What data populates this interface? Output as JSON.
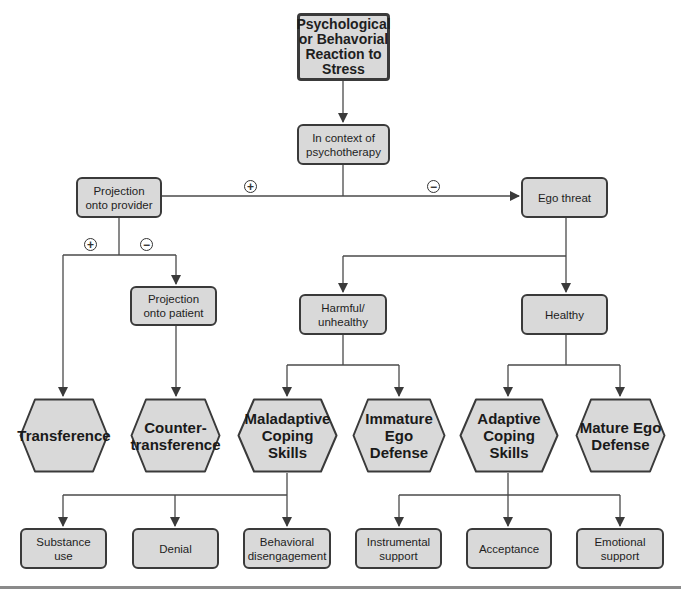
{
  "diagram": {
    "root": {
      "label": "Psychological or Behavorial Reaction to Stress"
    },
    "context": {
      "label": "In context of psychotherapy"
    },
    "branch_signs": {
      "to_projection": "+",
      "to_ego_threat": "−",
      "to_transference": "+",
      "to_projection_patient": "−"
    },
    "projection_provider": {
      "label": "Projection onto provider"
    },
    "projection_patient": {
      "label": "Projection onto patient"
    },
    "ego_threat": {
      "label": "Ego threat"
    },
    "harmful": {
      "label": "Harmful/ unhealthy"
    },
    "healthy": {
      "label": "Healthy"
    },
    "outcomes": [
      {
        "label": "Transference"
      },
      {
        "label": "Counter- transference"
      },
      {
        "label": "Maladaptive Coping Skills"
      },
      {
        "label": "Immature Ego Defense"
      },
      {
        "label": "Adaptive Coping Skills"
      },
      {
        "label": "Mature Ego Defense"
      }
    ],
    "maladaptive_examples": [
      {
        "label": "Substance use"
      },
      {
        "label": "Denial"
      },
      {
        "label": "Behavioral disengagement"
      }
    ],
    "adaptive_examples": [
      {
        "label": "Instrumental support"
      },
      {
        "label": "Acceptance"
      },
      {
        "label": "Emotional support"
      }
    ],
    "colors": {
      "node_fill": "#d9d9d9",
      "stroke": "#3a3a3a",
      "background": "#ffffff"
    }
  }
}
